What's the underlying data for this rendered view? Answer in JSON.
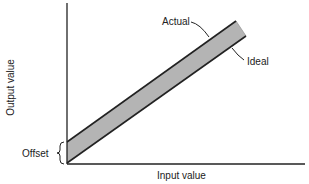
{
  "diagram": {
    "type": "offset error diagram",
    "xlabel": "Input value",
    "ylabel": "Output value",
    "labels": {
      "actual": "Actual",
      "ideal": "Ideal",
      "offset": "Offset"
    },
    "colors": {
      "band_fill": "#b4b4b4",
      "line": "#222222"
    }
  }
}
